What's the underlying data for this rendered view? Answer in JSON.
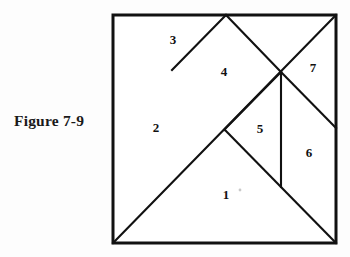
{
  "caption": {
    "text": "Figure 7-9"
  },
  "figure": {
    "title": "Figure 7-9",
    "type": "tangram-dissection",
    "shape": "square",
    "piece_count": 7,
    "colors": {
      "line": "#111111",
      "fill": "#ffffff",
      "background": "#fdfdfd",
      "text": "#1a1a1a"
    },
    "square": {
      "left": 113,
      "top": 15,
      "right": 336,
      "bottom": 243,
      "border_width": 3.0
    },
    "vertices": {
      "top_left": "113,15",
      "top_mid": "226,15",
      "top_right": "336,15",
      "right_mid": "336,128",
      "bottom_right": "336,243",
      "bottom_left": "113,243",
      "center": "225,130",
      "upper_left_notch": "172,70",
      "right_node": "281,72",
      "vertical_foot": "281,186"
    },
    "cuts": [
      {
        "name": "main-diagonal",
        "points": "113,243 336,15"
      },
      {
        "name": "apex-to-left-notch",
        "points": "226,15 172,70"
      },
      {
        "name": "apex-to-right-node",
        "points": "226,15 281,72"
      },
      {
        "name": "right-node-to-right-mid",
        "points": "281,72 336,128"
      },
      {
        "name": "center-to-bottom-right",
        "points": "225,130 336,243"
      },
      {
        "name": "right-node-to-center",
        "points": "281,72 225,130"
      },
      {
        "name": "vertical-divider",
        "points": "281,72 281,186"
      }
    ],
    "labels": [
      {
        "id": "1",
        "text": "1",
        "x": 226,
        "y": 196
      },
      {
        "id": "2",
        "text": "2",
        "x": 156,
        "y": 129
      },
      {
        "id": "3",
        "text": "3",
        "x": 173,
        "y": 41
      },
      {
        "id": "4",
        "text": "4",
        "x": 224,
        "y": 73
      },
      {
        "id": "5",
        "text": "5",
        "x": 260,
        "y": 130
      },
      {
        "id": "6",
        "text": "6",
        "x": 309,
        "y": 154
      },
      {
        "id": "7",
        "text": "7",
        "x": 313,
        "y": 69
      }
    ],
    "artifact": {
      "name": "scan-speck",
      "x": 240,
      "y": 190,
      "r": 1.4
    }
  }
}
